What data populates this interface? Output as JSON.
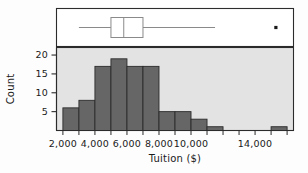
{
  "chart_data": {
    "type": "bar",
    "title": "",
    "subtitle": "",
    "xlabel": "Tuition ($)",
    "ylabel": "Count",
    "xlim": [
      1600,
      16400
    ],
    "ylim": [
      0,
      22
    ],
    "grid": false,
    "legend": "none",
    "bin_width": 1000,
    "categories": [
      "2,000-3,000",
      "3,000-4,000",
      "4,000-5,000",
      "5,000-6,000",
      "6,000-7,000",
      "7,000-8,000",
      "8,000-9,000",
      "9,000-10,000",
      "10,000-11,000",
      "11,000-12,000",
      "15,000-16,000"
    ],
    "bin_starts": [
      2000,
      3000,
      4000,
      5000,
      6000,
      7000,
      8000,
      9000,
      10000,
      11000,
      15000
    ],
    "values": [
      6,
      8,
      17,
      19,
      17,
      17,
      5,
      5,
      3,
      1,
      1
    ],
    "x_ticks": [
      2000,
      4000,
      6000,
      8000,
      10000,
      14000
    ],
    "x_tick_labels": [
      "2,000",
      "4,000",
      "6,000",
      "8,000",
      "10,000",
      "14,000"
    ],
    "y_ticks": [
      5,
      10,
      15,
      20
    ],
    "y_tick_labels": [
      "5",
      "10",
      "15",
      "20"
    ],
    "bar_color": "#666666",
    "bar_edge_color": "#2b2b2b",
    "panel_background": "#e3e3e3",
    "boxplot": {
      "orientation": "horizontal",
      "whisker_low": 3000,
      "q1": 5000,
      "median": 5800,
      "q3": 7000,
      "whisker_high": 11500,
      "outliers": [
        15300
      ],
      "box_fill": "#ffffff",
      "line_color": "#8a8a8a",
      "outlier_color": "#1a1a1a",
      "panel_background": "#ffffff"
    }
  }
}
